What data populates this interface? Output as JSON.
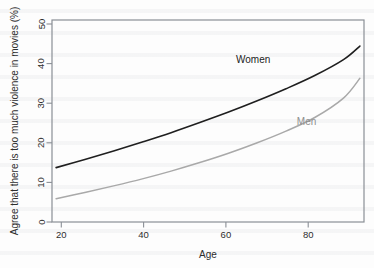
{
  "chart_data": {
    "type": "line",
    "title": "",
    "xlabel": "Age",
    "ylabel": "Agree that there is too much violence in movies (%)",
    "xlim": [
      17,
      93
    ],
    "ylim": [
      0,
      52
    ],
    "xticks": [
      20,
      40,
      60,
      80
    ],
    "xtick_labels": [
      "20",
      "40",
      "60",
      "80"
    ],
    "yticks": [
      0,
      10,
      20,
      30,
      40,
      50
    ],
    "ytick_labels": [
      "0",
      "10",
      "20",
      "30",
      "40",
      "50"
    ],
    "grid": false,
    "legend_position": "inline-annotation",
    "x": [
      18,
      25,
      32,
      39,
      46,
      53,
      60,
      67,
      74,
      81,
      88,
      92
    ],
    "series": [
      {
        "name": "Women",
        "color": "#1f1f1f",
        "label_x": 66,
        "label_y": 41,
        "values": [
          14.0,
          16.1,
          18.3,
          20.6,
          23.0,
          25.6,
          28.3,
          31.2,
          34.3,
          37.7,
          41.8,
          45.3
        ]
      },
      {
        "name": "Men",
        "color": "#a9a9a9",
        "label_x": 79,
        "label_y": 25,
        "values": [
          6.0,
          7.6,
          9.3,
          11.1,
          13.1,
          15.3,
          17.7,
          20.4,
          23.4,
          26.9,
          31.9,
          37.0
        ]
      }
    ]
  },
  "axes": {
    "x_title": "Age",
    "y_title": "Agree that there is too much violence in movies (%)"
  },
  "colors": {
    "women_line": "#1f1f1f",
    "men_line": "#a9a9a9",
    "frame": "#8a8f96",
    "text": "#2d2d2d",
    "background": "#fdfdfd"
  }
}
